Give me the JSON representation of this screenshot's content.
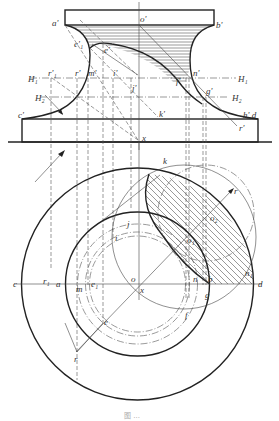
{
  "figure": {
    "caption": "图 ...",
    "front_view": {
      "labels": {
        "a_prime": "a'",
        "o_prime": "o'",
        "b_prime": "b'",
        "e1_prime": "e'₁",
        "e_prime": "e'",
        "H1_left": "H₁",
        "H1_right": "H₁",
        "H2_left": "H₂",
        "H2_right": "H₂",
        "r1_prime": "r'₁",
        "r_prime": "r'",
        "m_prime": "m'",
        "i_prime": "i'",
        "j_prime": "j'",
        "n_prime": "n'",
        "f_prime": "f'",
        "g_prime": "g'",
        "k_prime": "k'",
        "c_prime": "c'",
        "h_prime_d": "h' d",
        "r_prime_lower": "r'",
        "x": "x"
      }
    },
    "top_view": {
      "labels": {
        "k": "k",
        "r_top": "r",
        "o2": "o₂",
        "o1": "o₁",
        "j": "j",
        "i": "i",
        "c": "c",
        "r1": "r₁",
        "a": "a",
        "m": "m",
        "e1": "e₁",
        "o": "o",
        "x": "x",
        "n": "n",
        "b": "b",
        "g": "g",
        "n1": "n₁",
        "d": "d",
        "f": "f",
        "e": "e",
        "r_bottom": "r"
      }
    },
    "colors": {
      "line": "#222222",
      "construction": "#555555",
      "background": "#ffffff"
    }
  }
}
